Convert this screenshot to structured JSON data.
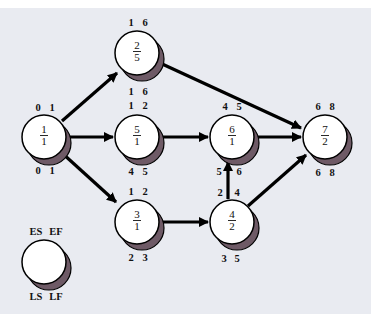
{
  "diagram": {
    "type": "activity-on-node network (critical path method)",
    "colors": {
      "background": "#e9ebf1",
      "node_fill": "#ffffff",
      "node_shadow": "#6e5a66",
      "edge": "#000000"
    },
    "nodes": [
      {
        "id": "1",
        "activity": "1",
        "duration": "1",
        "top_left": "0",
        "top_right": "1",
        "bottom_left": "0",
        "bottom_right": "1"
      },
      {
        "id": "2",
        "activity": "2",
        "duration": "5",
        "top_left": "1",
        "top_right": "6",
        "bottom_left": "1",
        "bottom_right": "6"
      },
      {
        "id": "5",
        "activity": "5",
        "duration": "1",
        "top_left": "1",
        "top_right": "2",
        "bottom_left": "4",
        "bottom_right": "5"
      },
      {
        "id": "6",
        "activity": "6",
        "duration": "1",
        "top_left": "4",
        "top_right": "5",
        "bottom_left": "5",
        "bottom_right": "6"
      },
      {
        "id": "7",
        "activity": "7",
        "duration": "2",
        "top_left": "6",
        "top_right": "8",
        "bottom_left": "6",
        "bottom_right": "8"
      },
      {
        "id": "3",
        "activity": "3",
        "duration": "1",
        "top_left": "1",
        "top_right": "2",
        "bottom_left": "2",
        "bottom_right": "3"
      },
      {
        "id": "4",
        "activity": "4",
        "duration": "2",
        "top_left": "2",
        "top_right": "4",
        "bottom_left": "3",
        "bottom_right": "5"
      }
    ],
    "edges": [
      {
        "from": "1",
        "to": "2"
      },
      {
        "from": "1",
        "to": "5"
      },
      {
        "from": "1",
        "to": "3"
      },
      {
        "from": "2",
        "to": "7"
      },
      {
        "from": "5",
        "to": "6"
      },
      {
        "from": "6",
        "to": "7"
      },
      {
        "from": "3",
        "to": "4"
      },
      {
        "from": "4",
        "to": "6"
      },
      {
        "from": "4",
        "to": "7"
      }
    ],
    "legend": {
      "top_left": "ES",
      "top_right": "EF",
      "bottom_left": "LS",
      "bottom_right": "LF"
    }
  }
}
